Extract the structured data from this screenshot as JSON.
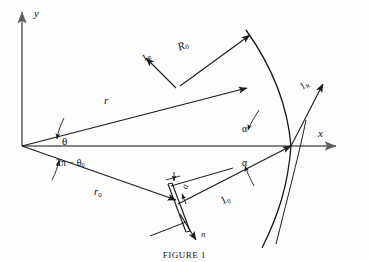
{
  "figure": {
    "caption": "FIGURE 1",
    "type": "geometry-diagram",
    "background_color": "#fdfdfd",
    "line_color": "#1a1a1a",
    "axis_color": "#6b6b6b"
  },
  "axes": {
    "y_label": "y",
    "x_label": "x",
    "origin_label": ""
  },
  "vectors": {
    "r": {
      "label": "r",
      "description": "position vector from origin to field point"
    },
    "r0": {
      "label": "r",
      "sub": "0",
      "description": "position vector from origin to aperture"
    },
    "R0": {
      "label": "R",
      "sub": "0",
      "description": "vector from aperture to observation point"
    },
    "unit_R_upper": {
      "label": "1",
      "sub": "R",
      "description": "unit vector along R upper"
    },
    "unit_R_lower": {
      "label": "1",
      "sub": "R",
      "description": "unit vector along R at surface"
    },
    "unit_0": {
      "label": "1",
      "sub": "0",
      "description": "unit vector along r0"
    },
    "normal": {
      "label": "n",
      "description": "outward normal of the aperture plane"
    }
  },
  "angles": {
    "theta": {
      "label": "θ"
    },
    "two_pi_minus_theta0": {
      "label": "2π − θ",
      "sub": "0"
    },
    "alpha_upper": {
      "label": "α"
    },
    "alpha_lower": {
      "label": "α"
    }
  },
  "aperture": {
    "width_label": "a",
    "description": "slit of width a"
  },
  "surface": {
    "description": "curved reflecting surface arc"
  }
}
